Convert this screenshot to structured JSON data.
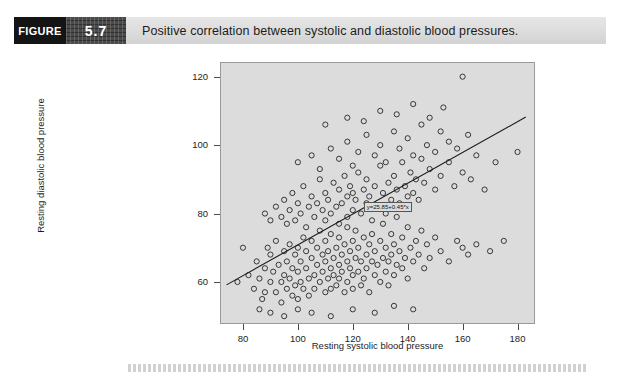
{
  "figure": {
    "label": "FIGURE",
    "number": "5.7",
    "caption": "Positive correlation between systolic and diastolic blood pressures."
  },
  "chart_data": {
    "type": "scatter",
    "title": "Positive correlation between systolic and diastolic blood pressures.",
    "xlabel": "Resting systolic blood pressure",
    "ylabel": "Resting diastolic blood pressure",
    "xlim": [
      72,
      186
    ],
    "ylim": [
      48,
      124
    ],
    "xticks": [
      80,
      100,
      120,
      140,
      160,
      180
    ],
    "yticks": [
      60,
      80,
      100,
      120
    ],
    "grid": false,
    "legend": null,
    "marker": "open-circle",
    "plot_background": "#dcdcdc",
    "annotation": "y=25.85+0.45*x",
    "fit_line": {
      "type": "linear",
      "intercept": 25.85,
      "slope": 0.45,
      "x_start": 74,
      "x_end": 183
    },
    "points": [
      [
        78,
        60
      ],
      [
        80,
        70
      ],
      [
        82,
        62
      ],
      [
        84,
        58
      ],
      [
        85,
        66
      ],
      [
        86,
        61
      ],
      [
        87,
        55
      ],
      [
        88,
        64
      ],
      [
        88,
        57
      ],
      [
        89,
        70
      ],
      [
        90,
        60
      ],
      [
        90,
        68
      ],
      [
        91,
        63
      ],
      [
        92,
        57
      ],
      [
        92,
        72
      ],
      [
        93,
        65
      ],
      [
        94,
        60
      ],
      [
        94,
        54
      ],
      [
        95,
        69
      ],
      [
        95,
        62
      ],
      [
        96,
        58
      ],
      [
        96,
        66
      ],
      [
        97,
        71
      ],
      [
        97,
        61
      ],
      [
        98,
        56
      ],
      [
        98,
        64
      ],
      [
        99,
        68
      ],
      [
        99,
        59
      ],
      [
        100,
        63
      ],
      [
        100,
        70
      ],
      [
        100,
        55
      ],
      [
        101,
        66
      ],
      [
        101,
        60
      ],
      [
        102,
        73
      ],
      [
        102,
        58
      ],
      [
        103,
        64
      ],
      [
        103,
        69
      ],
      [
        104,
        61
      ],
      [
        104,
        56
      ],
      [
        105,
        67
      ],
      [
        105,
        72
      ],
      [
        106,
        62
      ],
      [
        106,
        58
      ],
      [
        107,
        65
      ],
      [
        107,
        70
      ],
      [
        108,
        60
      ],
      [
        108,
        75
      ],
      [
        109,
        63
      ],
      [
        109,
        68
      ],
      [
        110,
        57
      ],
      [
        110,
        66
      ],
      [
        110,
        72
      ],
      [
        111,
        61
      ],
      [
        111,
        69
      ],
      [
        112,
        64
      ],
      [
        112,
        58
      ],
      [
        112,
        74
      ],
      [
        113,
        67
      ],
      [
        113,
        62
      ],
      [
        114,
        70
      ],
      [
        114,
        59
      ],
      [
        115,
        65
      ],
      [
        115,
        73
      ],
      [
        115,
        61
      ],
      [
        116,
        68
      ],
      [
        116,
        63
      ],
      [
        117,
        57
      ],
      [
        117,
        71
      ],
      [
        118,
        66
      ],
      [
        118,
        60
      ],
      [
        118,
        76
      ],
      [
        119,
        64
      ],
      [
        119,
        69
      ],
      [
        120,
        62
      ],
      [
        120,
        72
      ],
      [
        120,
        58
      ],
      [
        121,
        67
      ],
      [
        121,
        75
      ],
      [
        122,
        63
      ],
      [
        122,
        70
      ],
      [
        123,
        59
      ],
      [
        123,
        66
      ],
      [
        124,
        73
      ],
      [
        124,
        61
      ],
      [
        125,
        68
      ],
      [
        125,
        64
      ],
      [
        126,
        71
      ],
      [
        126,
        57
      ],
      [
        127,
        66
      ],
      [
        127,
        74
      ],
      [
        128,
        62
      ],
      [
        128,
        69
      ],
      [
        129,
        65
      ],
      [
        130,
        72
      ],
      [
        130,
        60
      ],
      [
        131,
        67
      ],
      [
        131,
        77
      ],
      [
        132,
        63
      ],
      [
        132,
        70
      ],
      [
        133,
        66
      ],
      [
        133,
        59
      ],
      [
        134,
        74
      ],
      [
        134,
        68
      ],
      [
        135,
        62
      ],
      [
        135,
        71
      ],
      [
        136,
        65
      ],
      [
        136,
        79
      ],
      [
        137,
        69
      ],
      [
        138,
        64
      ],
      [
        138,
        73
      ],
      [
        139,
        67
      ],
      [
        140,
        61
      ],
      [
        140,
        76
      ],
      [
        141,
        70
      ],
      [
        142,
        66
      ],
      [
        143,
        72
      ],
      [
        144,
        68
      ],
      [
        145,
        75
      ],
      [
        146,
        64
      ],
      [
        147,
        71
      ],
      [
        148,
        67
      ],
      [
        150,
        73
      ],
      [
        152,
        69
      ],
      [
        155,
        66
      ],
      [
        158,
        72
      ],
      [
        160,
        70
      ],
      [
        162,
        68
      ],
      [
        165,
        71
      ],
      [
        170,
        69
      ],
      [
        175,
        72
      ],
      [
        180,
        98
      ],
      [
        88,
        80
      ],
      [
        90,
        78
      ],
      [
        92,
        82
      ],
      [
        94,
        79
      ],
      [
        95,
        84
      ],
      [
        96,
        77
      ],
      [
        97,
        81
      ],
      [
        98,
        86
      ],
      [
        99,
        78
      ],
      [
        100,
        83
      ],
      [
        101,
        80
      ],
      [
        102,
        88
      ],
      [
        103,
        76
      ],
      [
        104,
        82
      ],
      [
        105,
        85
      ],
      [
        106,
        79
      ],
      [
        107,
        83
      ],
      [
        108,
        90
      ],
      [
        109,
        81
      ],
      [
        110,
        78
      ],
      [
        110,
        86
      ],
      [
        111,
        84
      ],
      [
        112,
        80
      ],
      [
        113,
        89
      ],
      [
        114,
        82
      ],
      [
        115,
        77
      ],
      [
        115,
        87
      ],
      [
        116,
        83
      ],
      [
        117,
        91
      ],
      [
        118,
        79
      ],
      [
        118,
        85
      ],
      [
        119,
        88
      ],
      [
        120,
        81
      ],
      [
        120,
        86
      ],
      [
        121,
        84
      ],
      [
        122,
        92
      ],
      [
        123,
        80
      ],
      [
        124,
        87
      ],
      [
        125,
        83
      ],
      [
        125,
        90
      ],
      [
        126,
        85
      ],
      [
        127,
        78
      ],
      [
        128,
        88
      ],
      [
        129,
        82
      ],
      [
        130,
        94
      ],
      [
        131,
        86
      ],
      [
        132,
        80
      ],
      [
        133,
        89
      ],
      [
        134,
        84
      ],
      [
        135,
        91
      ],
      [
        136,
        87
      ],
      [
        137,
        83
      ],
      [
        138,
        95
      ],
      [
        139,
        88
      ],
      [
        140,
        85
      ],
      [
        141,
        92
      ],
      [
        142,
        86
      ],
      [
        143,
        90
      ],
      [
        144,
        84
      ],
      [
        145,
        96
      ],
      [
        146,
        89
      ],
      [
        148,
        93
      ],
      [
        150,
        87
      ],
      [
        152,
        91
      ],
      [
        155,
        95
      ],
      [
        157,
        88
      ],
      [
        160,
        92
      ],
      [
        163,
        90
      ],
      [
        168,
        87
      ],
      [
        100,
        95
      ],
      [
        105,
        97
      ],
      [
        108,
        93
      ],
      [
        112,
        99
      ],
      [
        115,
        96
      ],
      [
        118,
        101
      ],
      [
        120,
        94
      ],
      [
        122,
        98
      ],
      [
        125,
        103
      ],
      [
        128,
        97
      ],
      [
        130,
        100
      ],
      [
        132,
        95
      ],
      [
        135,
        104
      ],
      [
        137,
        99
      ],
      [
        140,
        102
      ],
      [
        142,
        97
      ],
      [
        145,
        106
      ],
      [
        147,
        100
      ],
      [
        150,
        98
      ],
      [
        152,
        104
      ],
      [
        155,
        101
      ],
      [
        158,
        99
      ],
      [
        160,
        120
      ],
      [
        162,
        103
      ],
      [
        165,
        97
      ],
      [
        172,
        95
      ],
      [
        110,
        106
      ],
      [
        118,
        108
      ],
      [
        124,
        107
      ],
      [
        130,
        110
      ],
      [
        136,
        109
      ],
      [
        142,
        112
      ],
      [
        148,
        108
      ],
      [
        153,
        111
      ],
      [
        86,
        52
      ],
      [
        90,
        51
      ],
      [
        95,
        50
      ],
      [
        100,
        52
      ],
      [
        105,
        51
      ],
      [
        112,
        50
      ],
      [
        120,
        52
      ],
      [
        128,
        51
      ],
      [
        135,
        53
      ],
      [
        142,
        52
      ]
    ]
  }
}
